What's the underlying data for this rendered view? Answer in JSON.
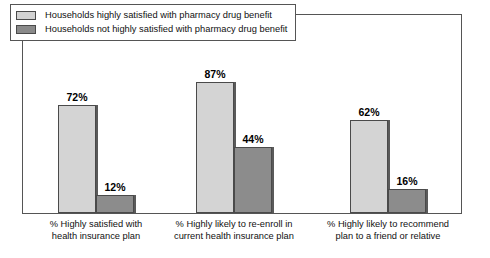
{
  "chart_data": {
    "type": "bar",
    "title": "",
    "subtitle": "",
    "xlabel": "",
    "ylabel": "",
    "ylim": [
      0,
      100
    ],
    "grid": false,
    "legend_position": "top-left",
    "value_suffix": "%",
    "categories": [
      "% Highly satisfied with\nhealth insurance plan",
      "% Highly likely to re-enroll in\ncurrent health insurance plan",
      "% Highly likely to recommend\nplan to a friend or relative"
    ],
    "category_lines": [
      [
        "% Highly satisfied with",
        "health insurance plan"
      ],
      [
        "% Highly likely to re-enroll in",
        "current health insurance plan"
      ],
      [
        "% Highly likely to recommend",
        "plan to a friend or relative"
      ]
    ],
    "series": [
      {
        "name": "Households highly satisfied with pharmacy drug benefit",
        "color": "#d4d4d4",
        "values": [
          72,
          87,
          62
        ],
        "labels": [
          "72%",
          "87%",
          "62%"
        ]
      },
      {
        "name": "Households not highly satisfied with pharmacy drug benefit",
        "color": "#8c8c8c",
        "values": [
          12,
          44,
          16
        ],
        "labels": [
          "12%",
          "44%",
          "16%"
        ]
      }
    ]
  },
  "legend": {
    "items": [
      {
        "label": "Households highly satisfied with pharmacy drug benefit",
        "swatch": "light"
      },
      {
        "label": "Households not highly satisfied with pharmacy drug benefit",
        "swatch": "dark"
      }
    ]
  },
  "colors": {
    "series_light": "#d4d4d4",
    "series_dark": "#8c8c8c",
    "frame": "#555555",
    "text": "#111111",
    "background": "#ffffff"
  }
}
